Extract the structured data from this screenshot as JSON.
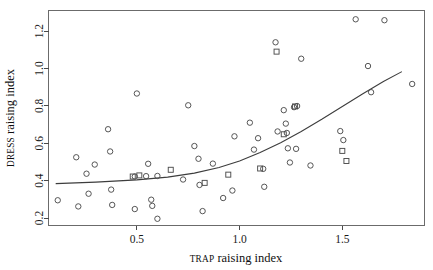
{
  "chart_data": {
    "type": "scatter",
    "title": "",
    "xlabel": "TRAP raising index",
    "xlabel_smallcaps_prefix": "TRAP",
    "xlabel_rest": " raising index",
    "ylabel": "DRESS raising index",
    "ylabel_smallcaps_prefix": "DRESS",
    "ylabel_rest": " raising index",
    "xlim": [
      0.07,
      1.9
    ],
    "ylim": [
      0.16,
      1.31
    ],
    "xticks": [
      0.5,
      1.0,
      1.5
    ],
    "xticklabels": [
      "0.5",
      "1.0",
      "1.5"
    ],
    "yticks": [
      0.2,
      0.4,
      0.6,
      0.8,
      1.0,
      1.2
    ],
    "yticklabels": [
      "0.2",
      "0.4",
      "0.6",
      "0.8",
      "1.0",
      "1.2"
    ],
    "grid": false,
    "legend": "none",
    "marker_styles": [
      "circle",
      "square"
    ],
    "series": [
      {
        "name": "circle-points",
        "marker": "circle",
        "points": [
          [
            0.115,
            0.295
          ],
          [
            0.205,
            0.525
          ],
          [
            0.215,
            0.262
          ],
          [
            0.255,
            0.437
          ],
          [
            0.265,
            0.33
          ],
          [
            0.295,
            0.486
          ],
          [
            0.36,
            0.675
          ],
          [
            0.37,
            0.556
          ],
          [
            0.375,
            0.352
          ],
          [
            0.38,
            0.27
          ],
          [
            0.49,
            0.248
          ],
          [
            0.5,
            0.866
          ],
          [
            0.49,
            0.422
          ],
          [
            0.545,
            0.424
          ],
          [
            0.555,
            0.49
          ],
          [
            0.57,
            0.298
          ],
          [
            0.575,
            0.265
          ],
          [
            0.6,
            0.425
          ],
          [
            0.6,
            0.196
          ],
          [
            0.725,
            0.406
          ],
          [
            0.75,
            0.803
          ],
          [
            0.78,
            0.585
          ],
          [
            0.8,
            0.517
          ],
          [
            0.805,
            0.377
          ],
          [
            0.82,
            0.237
          ],
          [
            0.87,
            0.491
          ],
          [
            0.92,
            0.307
          ],
          [
            0.965,
            0.347
          ],
          [
            0.975,
            0.637
          ],
          [
            1.05,
            0.71
          ],
          [
            1.07,
            0.566
          ],
          [
            1.09,
            0.627
          ],
          [
            1.115,
            0.463
          ],
          [
            1.12,
            0.367
          ],
          [
            1.175,
            1.14
          ],
          [
            1.185,
            0.663
          ],
          [
            1.215,
            0.777
          ],
          [
            1.225,
            0.705
          ],
          [
            1.23,
            0.655
          ],
          [
            1.235,
            0.573
          ],
          [
            1.245,
            0.497
          ],
          [
            1.265,
            0.793
          ],
          [
            1.28,
            0.799
          ],
          [
            1.275,
            0.57
          ],
          [
            1.3,
            1.052
          ],
          [
            1.345,
            0.481
          ],
          [
            1.49,
            0.665
          ],
          [
            1.505,
            0.617
          ],
          [
            1.565,
            1.263
          ],
          [
            1.625,
            1.013
          ],
          [
            1.64,
            0.873
          ],
          [
            1.705,
            1.258
          ],
          [
            1.84,
            0.917
          ]
        ]
      },
      {
        "name": "square-points",
        "marker": "square",
        "points": [
          [
            0.48,
            0.422
          ],
          [
            0.512,
            0.428
          ],
          [
            0.665,
            0.458
          ],
          [
            0.83,
            0.388
          ],
          [
            0.945,
            0.432
          ],
          [
            1.1,
            0.465
          ],
          [
            1.18,
            1.09
          ],
          [
            1.215,
            0.648
          ],
          [
            1.27,
            0.797
          ],
          [
            1.5,
            0.559
          ],
          [
            1.52,
            0.505
          ]
        ]
      }
    ],
    "fit_curve": {
      "name": "smoothed-fit",
      "points": [
        [
          0.105,
          0.384
        ],
        [
          0.3,
          0.392
        ],
        [
          0.5,
          0.404
        ],
        [
          0.65,
          0.419
        ],
        [
          0.78,
          0.44
        ],
        [
          0.9,
          0.47
        ],
        [
          1.0,
          0.505
        ],
        [
          1.1,
          0.55
        ],
        [
          1.2,
          0.603
        ],
        [
          1.3,
          0.663
        ],
        [
          1.4,
          0.728
        ],
        [
          1.5,
          0.797
        ],
        [
          1.6,
          0.865
        ],
        [
          1.7,
          0.93
        ],
        [
          1.79,
          0.983
        ]
      ]
    }
  }
}
